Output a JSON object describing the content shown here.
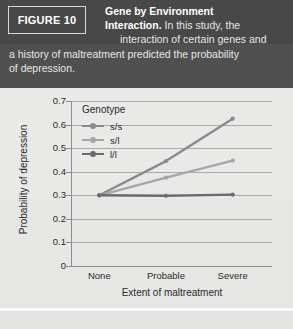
{
  "figure": {
    "tag": "FIGURE 10",
    "caption_bold": "Gene by Environment Interaction.",
    "caption_line1_bold": "Gene by Environment",
    "caption_line2_bold": "Interaction.",
    "caption_line2_rest": " In this study, the",
    "caption_line3": "interaction of certain genes and",
    "caption_line4": "a history of maltreatment predicted the probability",
    "caption_line5": "of depression."
  },
  "colors": {
    "header_bg": "#4a4a4a",
    "panel_bg": "#e9e9e7",
    "gridline": "#a9a9a7",
    "axis": "#8d8d8b",
    "series_ss": "#8a8a8a",
    "series_sl": "#a6a6a6",
    "series_ll": "#6b6b6b",
    "text_dark": "#2b2b2b",
    "text_light": "#e6e6e6"
  },
  "chart_data": {
    "type": "line",
    "title": "",
    "xlabel": "Extent of maltreatment",
    "ylabel": "Probability of depression",
    "categories": [
      "None",
      "Probable",
      "Severe"
    ],
    "ylim": [
      0,
      0.7
    ],
    "yticks": [
      "0",
      "0.1",
      "0.2",
      "0.3",
      "0.4",
      "0.5",
      "0.6",
      "0.7"
    ],
    "ytick_values": [
      0,
      0.1,
      0.2,
      0.3,
      0.4,
      0.5,
      0.6,
      0.7
    ],
    "grid": true,
    "legend_title": "Genotype",
    "legend_position": "upper-left-inside",
    "series": [
      {
        "name": "s/s",
        "values": [
          0.3,
          0.445,
          0.625
        ],
        "color": "#8a8a8a"
      },
      {
        "name": "s/l",
        "values": [
          0.3,
          0.375,
          0.447
        ],
        "color": "#a6a6a6"
      },
      {
        "name": "l/l",
        "values": [
          0.3,
          0.298,
          0.303
        ],
        "color": "#6b6b6b"
      }
    ]
  }
}
